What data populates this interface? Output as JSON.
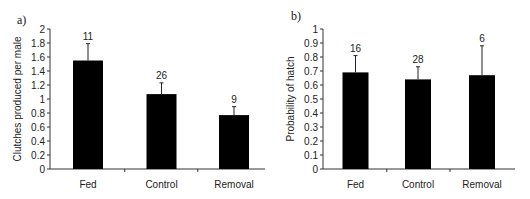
{
  "chart_data": [
    {
      "type": "bar",
      "panel_label": "a)",
      "title": "",
      "xlabel": "",
      "ylabel": "Clutches produced per male",
      "categories": [
        "Fed",
        "Control",
        "Removal"
      ],
      "values": [
        1.55,
        1.07,
        0.77
      ],
      "error_upper": [
        1.79,
        1.23,
        0.89
      ],
      "sample_sizes": [
        "11",
        "26",
        "9"
      ],
      "ylim": [
        0,
        2
      ],
      "yticks": [
        0,
        0.2,
        0.4,
        0.6,
        0.8,
        1,
        1.2,
        1.4,
        1.6,
        1.8,
        2
      ],
      "ytick_labels": [
        "0",
        "0.2",
        "0.4",
        "0.6",
        "0.8",
        "1",
        "1.2",
        "1.4",
        "1.6",
        "1.8",
        "2"
      ],
      "grid": false,
      "bar_color": "#000000"
    },
    {
      "type": "bar",
      "panel_label": "b)",
      "title": "",
      "xlabel": "",
      "ylabel": "Probability of hatch",
      "categories": [
        "Fed",
        "Control",
        "Removal"
      ],
      "values": [
        0.69,
        0.64,
        0.67
      ],
      "error_upper": [
        0.81,
        0.73,
        0.88
      ],
      "sample_sizes": [
        "16",
        "28",
        "6"
      ],
      "ylim": [
        0,
        1
      ],
      "yticks": [
        0,
        0.1,
        0.2,
        0.3,
        0.4,
        0.5,
        0.6,
        0.7,
        0.8,
        0.9,
        1
      ],
      "ytick_labels": [
        "0",
        "0.1",
        "0.2",
        "0.3",
        "0.4",
        "0.5",
        "0.6",
        "0.7",
        "0.8",
        "0.9",
        "1"
      ],
      "grid": false,
      "bar_color": "#000000"
    }
  ]
}
